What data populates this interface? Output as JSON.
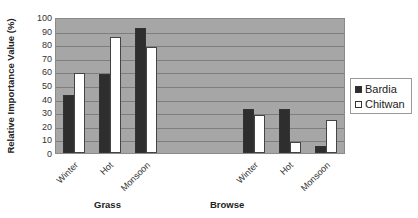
{
  "chart_data": {
    "type": "bar",
    "title": "",
    "ylabel": "Relative Importance Value (%)",
    "xlabel": "",
    "ylim": [
      0,
      100
    ],
    "yticks": [
      0,
      10,
      20,
      30,
      40,
      50,
      60,
      70,
      80,
      90,
      100
    ],
    "grid": true,
    "legend_position": "right",
    "groups": [
      "Grass",
      "Browse"
    ],
    "categories": [
      "Winter",
      "Hot",
      "Monsoon",
      "Winter",
      "Hot",
      "Monsoon"
    ],
    "category_groups": [
      "Grass",
      "Grass",
      "Grass",
      "Browse",
      "Browse",
      "Browse"
    ],
    "series": [
      {
        "name": "Bardia",
        "color": "#2e2e2e",
        "values": [
          43,
          58,
          92,
          32,
          32,
          5
        ]
      },
      {
        "name": "Chitwan",
        "color": "#ffffff",
        "values": [
          59,
          85,
          78,
          28,
          8,
          24
        ]
      }
    ]
  },
  "axis": {
    "ylabel": "Relative Importance Value (%)",
    "yticks": [
      "100",
      "90",
      "80",
      "70",
      "60",
      "50",
      "40",
      "30",
      "20",
      "10",
      "0"
    ]
  },
  "xticks": [
    "Winter",
    "Hot",
    "Monsoon",
    "Winter",
    "Hot",
    "Monsoon"
  ],
  "groups": [
    "Grass",
    "Browse"
  ],
  "legend": {
    "items": [
      "Bardia",
      "Chitwan"
    ]
  }
}
